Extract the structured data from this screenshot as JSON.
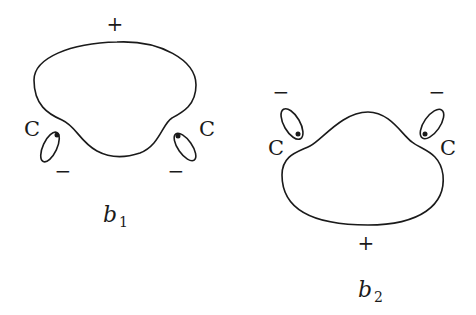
{
  "diagram": {
    "orbital_b1": {
      "name": "b1",
      "label_main": "b",
      "label_sub": "1",
      "lobe_sign_main": "+",
      "carbon_labels": [
        "C",
        "C"
      ],
      "lobe_signs_small": [
        "−",
        "−"
      ]
    },
    "orbital_b2": {
      "name": "b2",
      "label_main": "b",
      "label_sub": "2",
      "lobe_sign_main": "+",
      "carbon_labels": [
        "C",
        "C"
      ],
      "lobe_signs_small": [
        "−",
        "−"
      ]
    },
    "stroke_color": "#1a1a1a"
  }
}
